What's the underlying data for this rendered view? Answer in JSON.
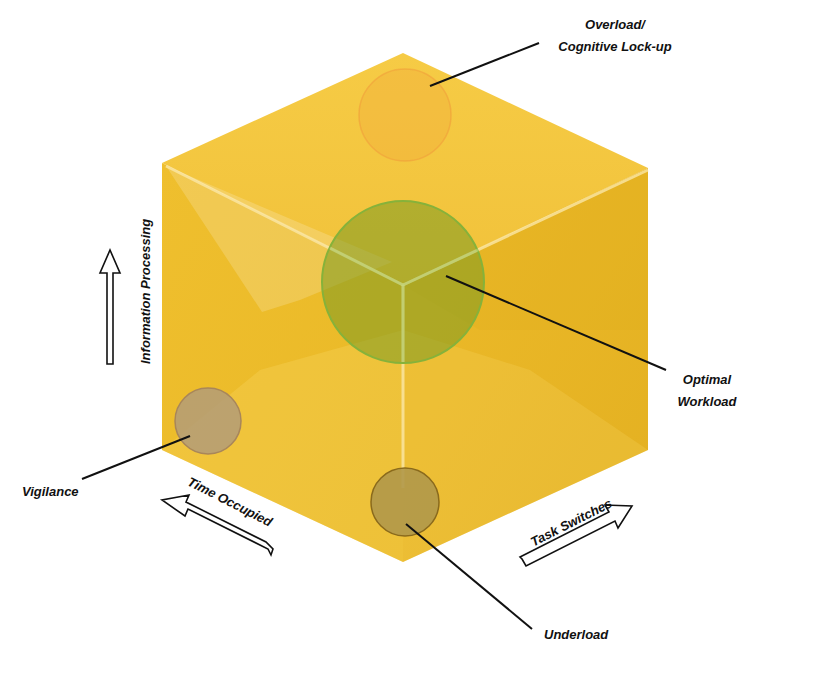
{
  "diagram": {
    "type": "isometric-cube-workload-model",
    "colors": {
      "cube_top": "#f3c63d",
      "cube_left": "#ebbb2a",
      "cube_right": "#e7b523",
      "edge_highlight": "#f8e6a0",
      "optimal_fill": "#8aa42a",
      "optimal_stroke": "#86b23a",
      "overload_fill": "#f2a93a",
      "overload_stroke": "#f09a3a",
      "vigilance_fill": "#b8a06a",
      "vigilance_stroke": "#a8865a",
      "underload_fill": "#b49d4a",
      "underload_stroke": "#8a6a1c",
      "leader_line": "#111111",
      "arrow_stroke": "#111111"
    },
    "axes": {
      "vertical": "Information Processing",
      "left": "Time Occupied",
      "right": "Task Switches"
    },
    "states": [
      {
        "id": "overload",
        "line1": "Overload/",
        "line2": "Cognitive Lock-up"
      },
      {
        "id": "optimal",
        "line1": "Optimal",
        "line2": "Workload"
      },
      {
        "id": "vigilance",
        "line1": "Vigilance"
      },
      {
        "id": "underload",
        "line1": "Underload"
      }
    ]
  }
}
